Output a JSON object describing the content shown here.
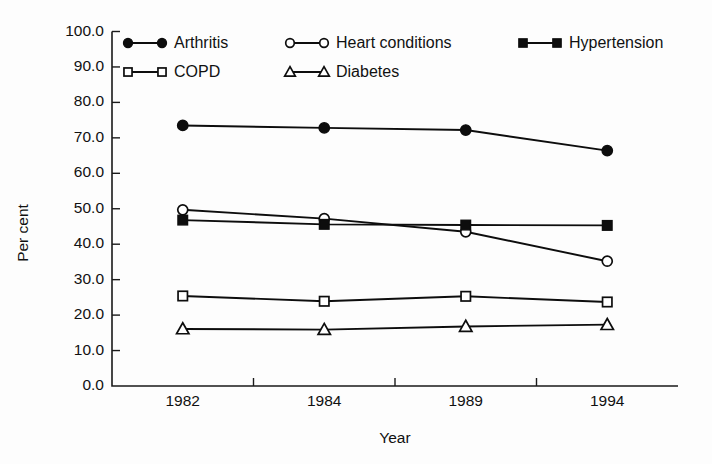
{
  "chart_data": {
    "type": "line",
    "title": "",
    "xlabel": "Year",
    "ylabel": "Per cent",
    "categories": [
      "1982",
      "1984",
      "1989",
      "1994"
    ],
    "ylim": [
      0.0,
      100.0
    ],
    "y_tick_step": 10.0,
    "y_tick_labels": [
      "0.0",
      "10.0",
      "20.0",
      "30.0",
      "40.0",
      "50.0",
      "60.0",
      "70.0",
      "80.0",
      "90.0",
      "100.0"
    ],
    "grid": false,
    "legend_position": "top-inside",
    "series": [
      {
        "name": "Arthritis",
        "marker": "filled-circle",
        "values": [
          73.5,
          72.8,
          72.2,
          66.4
        ]
      },
      {
        "name": "Heart conditions",
        "marker": "open-circle",
        "values": [
          49.7,
          47.2,
          43.5,
          35.2
        ]
      },
      {
        "name": "Hypertension",
        "marker": "filled-square",
        "values": [
          46.8,
          45.6,
          45.4,
          45.3
        ]
      },
      {
        "name": "COPD",
        "marker": "open-square",
        "values": [
          25.4,
          23.9,
          25.3,
          23.7
        ]
      },
      {
        "name": "Diabetes",
        "marker": "open-triangle",
        "values": [
          16.1,
          15.9,
          16.8,
          17.3
        ]
      }
    ]
  },
  "legend": {
    "entries": [
      {
        "label": "Arthritis",
        "marker": "filled-circle",
        "col": 0,
        "row": 0
      },
      {
        "label": "Heart conditions",
        "marker": "open-circle",
        "col": 1,
        "row": 0
      },
      {
        "label": "Hypertension",
        "marker": "filled-square",
        "col": 2,
        "row": 0
      },
      {
        "label": "COPD",
        "marker": "open-square",
        "col": 0,
        "row": 1
      },
      {
        "label": "Diabetes",
        "marker": "open-triangle",
        "col": 1,
        "row": 1
      }
    ]
  },
  "colors": {
    "ink": "#0d0d0d",
    "axis": "#1a1a1a",
    "background": "#ffffff",
    "marker_fill_open": "#ffffff"
  }
}
